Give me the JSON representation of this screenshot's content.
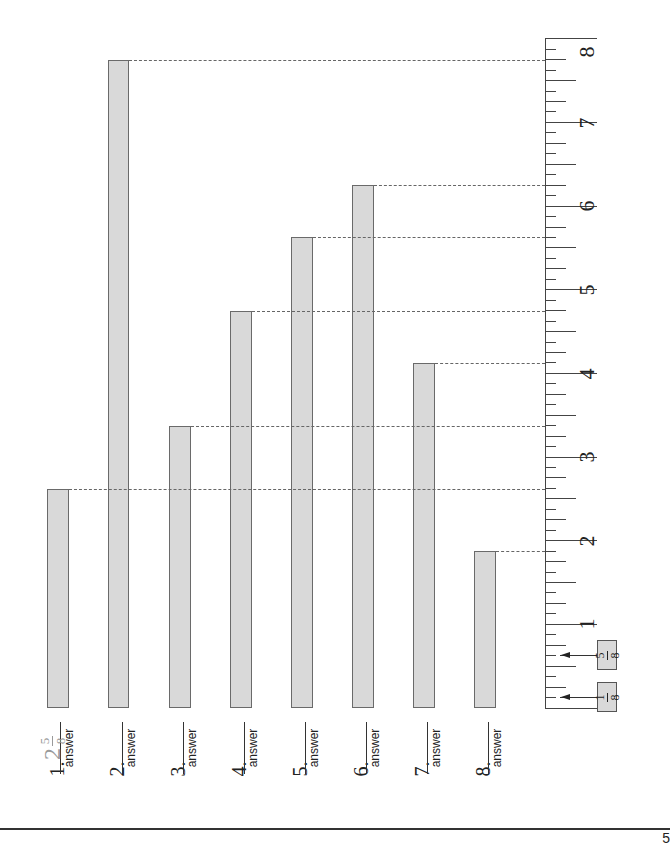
{
  "worksheet": {
    "instructions_hidden": false,
    "ruler": {
      "unit": "inch",
      "labels": [
        "1",
        "2",
        "3",
        "4",
        "5",
        "6",
        "7",
        "8"
      ],
      "subdivision": "eighths",
      "callouts": [
        {
          "label_num": "1",
          "label_den": "8",
          "value": 0.125
        },
        {
          "label_num": "5",
          "label_den": "8",
          "value": 0.625
        }
      ]
    },
    "questions": [
      {
        "number": "1.",
        "answer_label": "answer",
        "example_whole": "2",
        "example_num": "5",
        "example_den": "8"
      },
      {
        "number": "2.",
        "answer_label": "answer"
      },
      {
        "number": "3.",
        "answer_label": "answer"
      },
      {
        "number": "4.",
        "answer_label": "answer"
      },
      {
        "number": "5.",
        "answer_label": "answer"
      },
      {
        "number": "6.",
        "answer_label": "answer"
      },
      {
        "number": "7.",
        "answer_label": "answer"
      },
      {
        "number": "8.",
        "answer_label": "answer"
      }
    ],
    "page_number": "5"
  },
  "chart_data": {
    "type": "bar",
    "categories": [
      "1",
      "2",
      "3",
      "4",
      "5",
      "6",
      "7",
      "8"
    ],
    "values": [
      2.625,
      7.75,
      3.375,
      4.75,
      5.625,
      6.25,
      4.125,
      1.875
    ],
    "value_labels": [
      "2 5/8",
      "7 3/4",
      "3 3/8",
      "4 3/4",
      "5 5/8",
      "6 1/4",
      "4 1/8",
      "1 7/8"
    ],
    "xlabel": "",
    "ylabel": "inches",
    "ylim": [
      0,
      8
    ],
    "grid": false,
    "orientation": "rotated -90deg (ruler on right)"
  },
  "colors": {
    "bar_fill": "#d9d9d9",
    "bar_border": "#6a6a6a",
    "example_text": "#9a9a9a"
  }
}
